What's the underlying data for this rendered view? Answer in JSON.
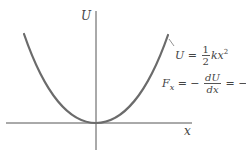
{
  "figure": {
    "type": "potential-energy-diagram",
    "axes": {
      "vertical_label": "U",
      "horizontal_label": "x"
    },
    "curve": {
      "shape": "parabola",
      "color": "#6b6b6b",
      "axis_color": "#555555"
    },
    "equations": {
      "potential": {
        "lhs": "U",
        "equals": "=",
        "coef_num": "1",
        "coef_den": "2",
        "term": "kx",
        "exp": "2"
      },
      "force": {
        "lhs": "F",
        "lhs_sub": "x",
        "eq1": "= −",
        "deriv_num": "dU",
        "deriv_den": "dx",
        "eq2": "= −",
        "rhs": "kx"
      }
    }
  }
}
